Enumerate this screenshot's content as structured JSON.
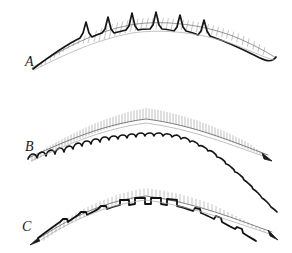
{
  "plate": {
    "title": "Comparative plate of three arched serrated specimens",
    "background_color": "#ffffff",
    "ink_color": "#1a1a1a",
    "hatch_color": "#6e6e6e",
    "width": 292,
    "height": 253,
    "technique": "pen-and-ink line engraving with hatching",
    "panel_count": 3
  },
  "panels": [
    {
      "id": "panel-a",
      "label": "A",
      "label_x": 25,
      "label_y": 63,
      "top": 0,
      "height": 85,
      "crest_type": "tall-pointed-spikes",
      "crest_count": 6,
      "crest_span_start_x": 86,
      "crest_span_end_x": 204,
      "arc_left_x": 32,
      "arc_right_x": 276,
      "arc_apex_x": 148,
      "arc_apex_y": 18,
      "arc_left_y": 68,
      "arc_right_y": 56,
      "band_thickness": 9,
      "hatch_direction": "diagonal",
      "hatch_line_count": 46,
      "description": "Broad shallow arch; six tall sharply pointed tubercles clustered on the apex; band tapers to fine points at both ends."
    },
    {
      "id": "panel-b",
      "label": "B",
      "label_x": 25,
      "label_y": 148,
      "top": 85,
      "height": 85,
      "crest_type": "small-rounded-scallops",
      "crest_count": 28,
      "crest_span_start_x": 30,
      "crest_span_end_x": 268,
      "arc_left_x": 28,
      "arc_right_x": 272,
      "arc_apex_x": 150,
      "arc_apex_y": 102,
      "arc_left_y": 158,
      "arc_right_y": 152,
      "band_thickness": 12,
      "hatch_direction": "vertical",
      "hatch_line_count": 92,
      "description": "Evenly arched band bearing about twenty-eight low rounded scallops along its entire upper margin; interior filled with dense vertical hatching."
    },
    {
      "id": "panel-c",
      "label": "C",
      "label_x": 22,
      "label_y": 228,
      "top": 168,
      "height": 85,
      "crest_type": "blocky-square-tubercles",
      "crest_count": 5,
      "crest_span_start_x": 110,
      "crest_span_end_x": 182,
      "secondary_crest_count": 4,
      "arc_left_x": 38,
      "arc_right_x": 272,
      "arc_apex_x": 150,
      "arc_apex_y": 186,
      "arc_left_y": 238,
      "arc_right_y": 230,
      "band_thickness": 9,
      "hatch_direction": "vertical",
      "hatch_line_count": 60,
      "description": "Arched band with five squared blocky tubercles on the apex and a few smaller knobs toward each tapering end."
    }
  ]
}
